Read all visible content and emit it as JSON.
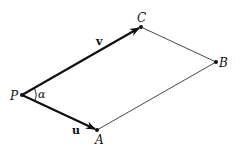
{
  "diagram": {
    "points": {
      "P": {
        "label": "P"
      },
      "A": {
        "label": "A"
      },
      "B": {
        "label": "B"
      },
      "C": {
        "label": "C"
      }
    },
    "vectors": {
      "u": {
        "label": "u",
        "from": "P",
        "to": "A"
      },
      "v": {
        "label": "v",
        "from": "P",
        "to": "C"
      }
    },
    "edges": [
      {
        "from": "C",
        "to": "B"
      },
      {
        "from": "A",
        "to": "B"
      }
    ],
    "angle": {
      "label": "α",
      "at": "P",
      "between": [
        "u",
        "v"
      ]
    },
    "colors": {
      "ink": "#111111",
      "thin": "#333333",
      "background": "#ffffff"
    }
  }
}
